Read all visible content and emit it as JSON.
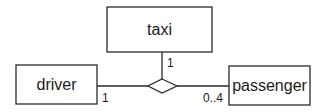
{
  "diagram": {
    "type": "UML n-ary association",
    "classes": [
      {
        "id": "taxi",
        "label": "taxi"
      },
      {
        "id": "driver",
        "label": "driver"
      },
      {
        "id": "passenger",
        "label": "passenger"
      }
    ],
    "association": {
      "shape": "diamond",
      "ends": [
        {
          "class": "taxi",
          "multiplicity": "1"
        },
        {
          "class": "driver",
          "multiplicity": "1"
        },
        {
          "class": "passenger",
          "multiplicity": "0..4"
        }
      ]
    }
  },
  "colors": {
    "stroke": "#2a2a2a",
    "text": "#1a1a1a",
    "background": "#ffffff"
  }
}
